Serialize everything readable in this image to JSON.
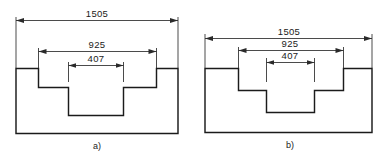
{
  "sheet": {
    "background_color": "#ffffff",
    "line_color": "#1b1b1b",
    "dimension_line_color": "#2a2a2a"
  },
  "figures": [
    {
      "id": "a",
      "caption": "a)",
      "dimensions": [
        {
          "name": "overall-width",
          "value": "1505"
        },
        {
          "name": "middle-step-width",
          "value": "925"
        },
        {
          "name": "inner-notch-width",
          "value": "407"
        }
      ]
    },
    {
      "id": "b",
      "caption": "b)",
      "dimensions": [
        {
          "name": "overall-width",
          "value": "1505"
        },
        {
          "name": "middle-step-width",
          "value": "925"
        },
        {
          "name": "inner-notch-width",
          "value": "407"
        }
      ]
    }
  ]
}
